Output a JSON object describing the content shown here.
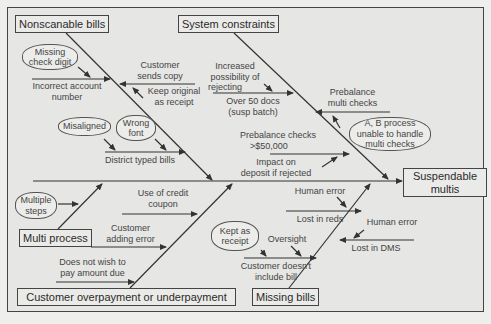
{
  "diagram": {
    "type": "fishbone",
    "effect": "Suspendable multis",
    "categories": {
      "nonscanable": {
        "label": "Nonscanable bills",
        "causes": {
          "incorrect_account": "Incorrect account number",
          "incorrect_account_l1": "Incorrect account",
          "incorrect_account_l2": "number",
          "missing_check_digit_l1": "Missing",
          "missing_check_digit_l2": "check digit",
          "customer_sends_copy_l1": "Customer",
          "customer_sends_copy_l2": "sends copy",
          "keep_original_l1": "Keep original",
          "keep_original_l2": "as receipt",
          "misaligned": "Misaligned",
          "wrong_font_l1": "Wrong",
          "wrong_font_l2": "font",
          "district_typed": "District typed bills"
        }
      },
      "system": {
        "label": "System constraints",
        "causes": {
          "increased_l1": "Increased",
          "increased_l2": "possibility of",
          "increased_l3": "rejecting",
          "over50_l1": "Over 50 docs",
          "over50_l2": "(susp batch)",
          "prebalance_multi_l1": "Prebalance",
          "prebalance_multi_l2": "multi checks",
          "ab_process_l1": "A, B process",
          "ab_process_l2": "unable to handle",
          "ab_process_l3": "multi checks",
          "prebalance_50k_l1": "Prebalance checks",
          "prebalance_50k_l2": ">$50,000",
          "impact_l1": "Impact on",
          "impact_l2": "deposit if rejected"
        }
      },
      "multi_process": {
        "label": "Multi process",
        "causes": {
          "multiple_steps_l1": "Multiple",
          "multiple_steps_l2": "steps"
        }
      },
      "overpayment": {
        "label": "Customer overpayment or underpayment",
        "causes": {
          "credit_coupon_l1": "Use of credit",
          "credit_coupon_l2": "coupon",
          "adding_error_l1": "Customer",
          "adding_error_l2": "adding error",
          "not_wish_l1": "Does not wish to",
          "not_wish_l2": "pay amount due"
        }
      },
      "missing_bills": {
        "label": "Missing bills",
        "causes": {
          "human_error_1": "Human error",
          "lost_reds": "Lost in reds",
          "human_error_2": "Human error",
          "lost_dms": "Lost in DMS",
          "kept_receipt_l1": "Kept as",
          "kept_receipt_l2": "receipt",
          "oversight": "Oversight",
          "doesnt_include_l1": "Customer doesn't",
          "doesnt_include_l2": "include bill"
        }
      }
    }
  }
}
